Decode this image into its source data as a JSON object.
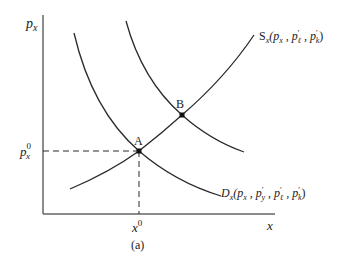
{
  "figure": {
    "caption": "(a)",
    "axes": {
      "y_label": "p",
      "y_label_sub": "x",
      "x_label": "x"
    },
    "ticks": {
      "price_equilibrium": {
        "base": "p",
        "sup": "0",
        "sub": "x"
      },
      "quantity_equilibrium": {
        "base": "x",
        "sup": "0"
      }
    },
    "points": [
      {
        "label": "A"
      },
      {
        "label": "B"
      }
    ],
    "curves": {
      "supply": {
        "label": "S",
        "label_sub": "x",
        "args": "(p",
        "args_sub1": "x",
        "args_mid1": " , p",
        "args_sup1": "′",
        "args_sub2": "ℓ",
        "args_mid2": " , p",
        "args_sup2": "′",
        "args_sub3": "k",
        "args_end": ")"
      },
      "demand": {
        "label": "D",
        "label_sub": "x",
        "args": "(p",
        "args_sub1": "x",
        "args_mid1": " , p",
        "args_sup1": "′",
        "args_sub2": "y",
        "args_mid2": " , p",
        "args_sup2": "′",
        "args_sub3": "ℓ",
        "args_mid3": " , p",
        "args_sup3": "′",
        "args_sub4": "k",
        "args_end": ")"
      }
    },
    "colors": {
      "line": "#2a2a2a",
      "axis": "#666666"
    }
  }
}
